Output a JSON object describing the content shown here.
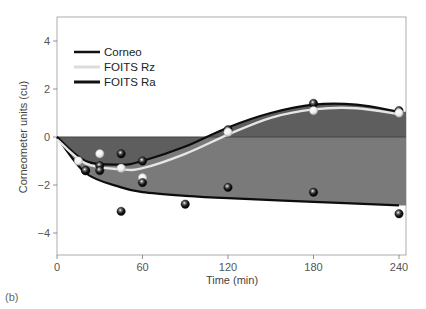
{
  "chart_data": {
    "type": "line",
    "title": "",
    "xlabel": "Time (min)",
    "ylabel": "Corneometer units (cu)",
    "xlim": [
      0,
      240
    ],
    "ylim": [
      -5,
      5
    ],
    "xticks": [
      0,
      60,
      120,
      180,
      240
    ],
    "yticks": [
      -4,
      -2,
      0,
      2,
      4
    ],
    "grid": false,
    "legend_position": "upper left",
    "panel_label": "(b)",
    "series": [
      {
        "name": "Corneo",
        "color": "#111111",
        "marker": "black sphere",
        "x": [
          20,
          30,
          45,
          60,
          120,
          180,
          240
        ],
        "y": [
          -1.4,
          -1.2,
          -0.7,
          -1.0,
          0.3,
          1.4,
          1.1
        ],
        "fit_curve": {
          "x": [
            0,
            20,
            45,
            60,
            90,
            120,
            150,
            180,
            210,
            240
          ],
          "y": [
            0,
            -1.0,
            -1.15,
            -1.0,
            -0.4,
            0.4,
            1.0,
            1.35,
            1.35,
            1.05
          ]
        }
      },
      {
        "name": "FOITS Rz",
        "color": "#e0e0e0",
        "marker": "white sphere",
        "x": [
          15,
          30,
          45,
          60,
          120,
          180,
          240
        ],
        "y": [
          -1.0,
          -0.7,
          -1.3,
          -1.7,
          0.2,
          1.1,
          1.0
        ],
        "fit_curve": {
          "x": [
            0,
            20,
            45,
            60,
            90,
            120,
            150,
            180,
            210,
            240
          ],
          "y": [
            -0.1,
            -1.1,
            -1.35,
            -1.3,
            -0.7,
            0.1,
            0.8,
            1.15,
            1.2,
            0.95
          ]
        }
      },
      {
        "name": "FOITS Ra",
        "color": "#111111",
        "marker": "black sphere",
        "x": [
          20,
          30,
          45,
          60,
          90,
          120,
          180,
          240
        ],
        "y": [
          -1.4,
          -1.4,
          -3.1,
          -1.9,
          -2.8,
          -2.1,
          -2.3,
          -3.2
        ],
        "fit_curve": {
          "x": [
            0,
            20,
            45,
            60,
            90,
            120,
            180,
            240
          ],
          "y": [
            0,
            -1.5,
            -2.1,
            -2.3,
            -2.45,
            -2.55,
            -2.7,
            -2.85
          ]
        }
      }
    ]
  },
  "legend": {
    "items": [
      {
        "label": "Corneo"
      },
      {
        "label": "FOITS Rz"
      },
      {
        "label": "FOITS Ra"
      }
    ]
  },
  "axes": {
    "x_title": "Time (min)",
    "y_title": "Corneometer units (cu)",
    "x_ticks": [
      "0",
      "60",
      "120",
      "180",
      "240"
    ],
    "y_ticks": [
      "4",
      "2",
      "0",
      "−2",
      "−4"
    ]
  },
  "panel_label": "(b)"
}
